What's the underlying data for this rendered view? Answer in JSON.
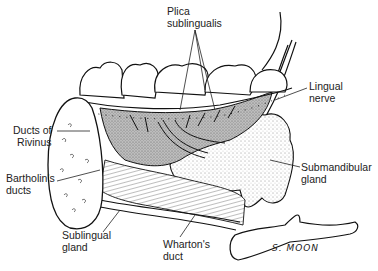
{
  "diagram": {
    "labels": [
      {
        "id": "plica-sublingualis",
        "line1": "Plica",
        "line2": "sublingualis",
        "x": 167,
        "y": 5,
        "align": "left"
      },
      {
        "id": "lingual-nerve",
        "line1": "Lingual",
        "line2": "nerve",
        "x": 309,
        "y": 80,
        "align": "left"
      },
      {
        "id": "ducts-of-rivinus",
        "line1": "Ducts of",
        "line2": "Rivinus",
        "x": 13,
        "y": 124,
        "align": "right"
      },
      {
        "id": "bartholins-ducts",
        "line1": "Bartholin's",
        "line2": "ducts",
        "x": 6,
        "y": 172,
        "align": "left"
      },
      {
        "id": "submandibular-gland",
        "line1": "Submandibular",
        "line2": "gland",
        "x": 301,
        "y": 161,
        "align": "left"
      },
      {
        "id": "sublingual-gland",
        "line1": "Sublingual",
        "line2": "gland",
        "x": 62,
        "y": 229,
        "align": "left"
      },
      {
        "id": "whartons-duct",
        "line1": "Wharton's",
        "line2": "duct",
        "x": 163,
        "y": 238,
        "align": "left"
      }
    ],
    "signature": "S. MOON"
  }
}
